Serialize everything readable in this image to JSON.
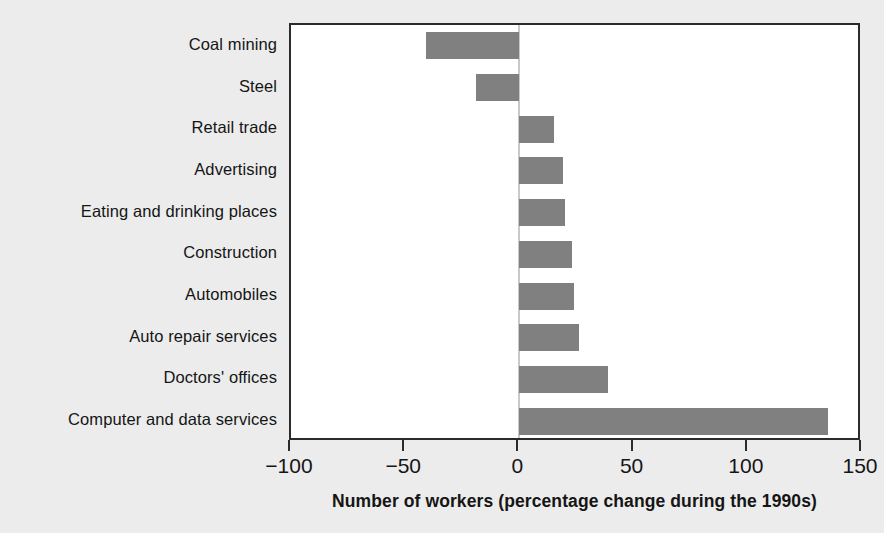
{
  "chart_data": {
    "type": "bar",
    "orientation": "horizontal",
    "title": "",
    "xlabel": "Number of workers (percentage change during the 1990s)",
    "ylabel": "",
    "xlim": [
      -100,
      150
    ],
    "xticks": [
      -100,
      -50,
      0,
      50,
      100,
      150
    ],
    "xtick_labels": [
      "−100",
      "−50",
      "0",
      "50",
      "100",
      "150"
    ],
    "grid": false,
    "legend": null,
    "zero_reference_line": true,
    "categories": [
      "Coal mining",
      "Steel",
      "Retail trade",
      "Advertising",
      "Eating and drinking places",
      "Construction",
      "Automobiles",
      "Auto repair services",
      "Doctors' offices",
      "Computer and data services"
    ],
    "values": [
      -41,
      -19,
      15,
      19,
      20,
      23,
      24,
      26,
      39,
      135
    ],
    "bar_color": "#808080",
    "plot_background": "#ffffff",
    "figure_background": "#ececec",
    "axis_color": "#2b2b2b"
  }
}
